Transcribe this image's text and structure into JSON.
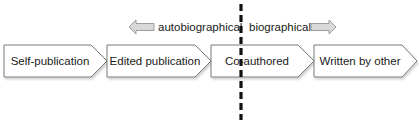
{
  "diagram": {
    "stages": [
      {
        "label": "Self-publication"
      },
      {
        "label": "Edited publication"
      },
      {
        "label": "Co-authored"
      },
      {
        "label": "Written by other"
      }
    ],
    "arrows": {
      "left": {
        "label": "autobiographical",
        "direction": "left"
      },
      "right": {
        "label": "biographical",
        "direction": "right"
      }
    },
    "divider": {
      "style": "dashed",
      "color": "#111111"
    },
    "colors": {
      "box_fill": "#ffffff",
      "box_stroke": "#7a7a7a",
      "arrow_fill": "#d9d9d9",
      "arrow_stroke": "#8a8a8a",
      "text": "#1a1a1a"
    }
  }
}
